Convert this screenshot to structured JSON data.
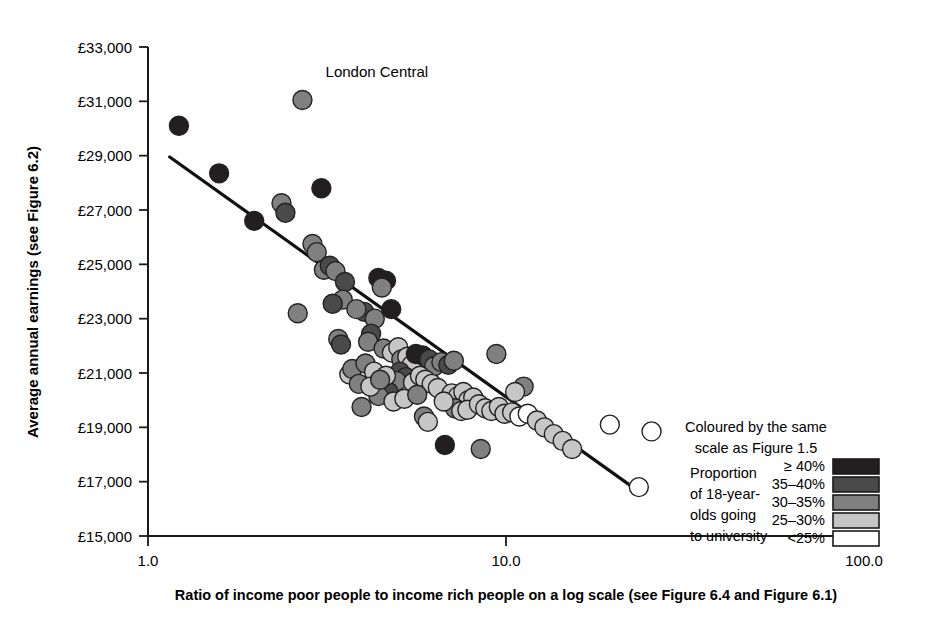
{
  "chart_data": {
    "type": "scatter",
    "title": "",
    "xlabel": "Ratio of income poor people to income rich people on a log scale (see Figure 6.4 and Figure 6.1)",
    "ylabel": "Average annual earnings (see Figure 6.2)",
    "xscale": "log",
    "xlim": [
      1.0,
      100.0
    ],
    "ylim": [
      15000,
      33000
    ],
    "xticks": [
      "1.0",
      "10.0",
      "100.0"
    ],
    "xtick_values": [
      1.0,
      10.0,
      100.0
    ],
    "yticks": [
      "£15,000",
      "£17,000",
      "£19,000",
      "£21,000",
      "£23,000",
      "£25,000",
      "£27,000",
      "£29,000",
      "£31,000",
      "£33,000"
    ],
    "ytick_values": [
      15000,
      17000,
      19000,
      21000,
      23000,
      25000,
      27000,
      29000,
      31000,
      33000
    ],
    "grid": false,
    "legend_position": "bottom-right",
    "annotations": [
      {
        "text": "London Central",
        "x": 3.2,
        "y": 31900
      }
    ],
    "trendline": {
      "type": "linear-on-log",
      "x_start": 1.15,
      "y_start": 28950,
      "x_end": 24.0,
      "y_end": 16550
    },
    "color_bins": [
      {
        "label": "≥ 40%",
        "color": "#231f20"
      },
      {
        "label": "35–40%",
        "color": "#4a4a4a"
      },
      {
        "label": "30–35%",
        "color": "#808080"
      },
      {
        "label": "25–30%",
        "color": "#c6c6c6"
      },
      {
        "label": "<25%",
        "color": "#ffffff"
      }
    ],
    "points": [
      {
        "x": 1.22,
        "y": 30100,
        "bin": 0
      },
      {
        "x": 1.58,
        "y": 28350,
        "bin": 0
      },
      {
        "x": 2.7,
        "y": 31050,
        "bin": 2
      },
      {
        "x": 3.05,
        "y": 27800,
        "bin": 0
      },
      {
        "x": 1.98,
        "y": 26600,
        "bin": 0
      },
      {
        "x": 2.36,
        "y": 27250,
        "bin": 2
      },
      {
        "x": 2.42,
        "y": 26900,
        "bin": 1
      },
      {
        "x": 2.88,
        "y": 25750,
        "bin": 2
      },
      {
        "x": 2.96,
        "y": 25450,
        "bin": 2
      },
      {
        "x": 3.1,
        "y": 24800,
        "bin": 2
      },
      {
        "x": 3.22,
        "y": 24950,
        "bin": 1
      },
      {
        "x": 3.34,
        "y": 24750,
        "bin": 2
      },
      {
        "x": 3.55,
        "y": 24350,
        "bin": 1
      },
      {
        "x": 3.5,
        "y": 23700,
        "bin": 2
      },
      {
        "x": 4.4,
        "y": 24500,
        "bin": 0
      },
      {
        "x": 4.62,
        "y": 24400,
        "bin": 0
      },
      {
        "x": 4.5,
        "y": 24150,
        "bin": 2
      },
      {
        "x": 4.02,
        "y": 23250,
        "bin": 1
      },
      {
        "x": 3.82,
        "y": 23350,
        "bin": 2
      },
      {
        "x": 3.4,
        "y": 22250,
        "bin": 2
      },
      {
        "x": 3.46,
        "y": 22050,
        "bin": 1
      },
      {
        "x": 4.3,
        "y": 23000,
        "bin": 2
      },
      {
        "x": 4.78,
        "y": 23350,
        "bin": 0
      },
      {
        "x": 4.2,
        "y": 22450,
        "bin": 1
      },
      {
        "x": 4.12,
        "y": 22150,
        "bin": 2
      },
      {
        "x": 4.55,
        "y": 21900,
        "bin": 2
      },
      {
        "x": 4.8,
        "y": 21750,
        "bin": 3
      },
      {
        "x": 5.0,
        "y": 21950,
        "bin": 3
      },
      {
        "x": 5.1,
        "y": 21500,
        "bin": 2
      },
      {
        "x": 5.3,
        "y": 21600,
        "bin": 3
      },
      {
        "x": 5.45,
        "y": 21300,
        "bin": 3
      },
      {
        "x": 5.6,
        "y": 21700,
        "bin": 0
      },
      {
        "x": 5.85,
        "y": 21650,
        "bin": 0
      },
      {
        "x": 6.1,
        "y": 21500,
        "bin": 1
      },
      {
        "x": 6.3,
        "y": 21250,
        "bin": 2
      },
      {
        "x": 5.05,
        "y": 21050,
        "bin": 1
      },
      {
        "x": 5.25,
        "y": 20850,
        "bin": 1
      },
      {
        "x": 4.95,
        "y": 20700,
        "bin": 2
      },
      {
        "x": 5.5,
        "y": 20650,
        "bin": 3
      },
      {
        "x": 5.75,
        "y": 20900,
        "bin": 3
      },
      {
        "x": 5.95,
        "y": 20750,
        "bin": 3
      },
      {
        "x": 6.2,
        "y": 20600,
        "bin": 3
      },
      {
        "x": 6.45,
        "y": 20450,
        "bin": 3
      },
      {
        "x": 4.7,
        "y": 20300,
        "bin": 1
      },
      {
        "x": 4.4,
        "y": 20150,
        "bin": 2
      },
      {
        "x": 4.85,
        "y": 19950,
        "bin": 3
      },
      {
        "x": 5.2,
        "y": 20050,
        "bin": 3
      },
      {
        "x": 3.95,
        "y": 19750,
        "bin": 2
      },
      {
        "x": 6.6,
        "y": 21400,
        "bin": 2
      },
      {
        "x": 6.9,
        "y": 21300,
        "bin": 1
      },
      {
        "x": 7.15,
        "y": 21450,
        "bin": 2
      },
      {
        "x": 9.4,
        "y": 21700,
        "bin": 2
      },
      {
        "x": 7.05,
        "y": 20250,
        "bin": 3
      },
      {
        "x": 7.35,
        "y": 20150,
        "bin": 3
      },
      {
        "x": 7.6,
        "y": 20300,
        "bin": 3
      },
      {
        "x": 7.85,
        "y": 20000,
        "bin": 3
      },
      {
        "x": 8.1,
        "y": 20100,
        "bin": 3
      },
      {
        "x": 7.2,
        "y": 19700,
        "bin": 2
      },
      {
        "x": 7.5,
        "y": 19600,
        "bin": 3
      },
      {
        "x": 7.8,
        "y": 19650,
        "bin": 3
      },
      {
        "x": 8.4,
        "y": 19850,
        "bin": 3
      },
      {
        "x": 8.75,
        "y": 19700,
        "bin": 3
      },
      {
        "x": 9.1,
        "y": 19600,
        "bin": 3
      },
      {
        "x": 9.55,
        "y": 19750,
        "bin": 3
      },
      {
        "x": 9.9,
        "y": 19500,
        "bin": 3
      },
      {
        "x": 10.4,
        "y": 19550,
        "bin": 3
      },
      {
        "x": 10.9,
        "y": 19400,
        "bin": 4
      },
      {
        "x": 11.5,
        "y": 19500,
        "bin": 4
      },
      {
        "x": 11.2,
        "y": 20500,
        "bin": 2
      },
      {
        "x": 10.6,
        "y": 20300,
        "bin": 3
      },
      {
        "x": 12.2,
        "y": 19250,
        "bin": 3
      },
      {
        "x": 12.8,
        "y": 19000,
        "bin": 3
      },
      {
        "x": 13.6,
        "y": 18750,
        "bin": 3
      },
      {
        "x": 14.4,
        "y": 18500,
        "bin": 3
      },
      {
        "x": 15.3,
        "y": 18200,
        "bin": 3
      },
      {
        "x": 19.5,
        "y": 19100,
        "bin": 4
      },
      {
        "x": 25.5,
        "y": 18850,
        "bin": 4
      },
      {
        "x": 23.5,
        "y": 16800,
        "bin": 4
      },
      {
        "x": 6.75,
        "y": 18350,
        "bin": 0
      },
      {
        "x": 8.5,
        "y": 18200,
        "bin": 2
      },
      {
        "x": 5.9,
        "y": 19400,
        "bin": 2
      },
      {
        "x": 6.05,
        "y": 19200,
        "bin": 3
      },
      {
        "x": 3.65,
        "y": 20950,
        "bin": 3
      },
      {
        "x": 3.72,
        "y": 21150,
        "bin": 2
      },
      {
        "x": 4.05,
        "y": 21350,
        "bin": 2
      },
      {
        "x": 4.28,
        "y": 21050,
        "bin": 3
      },
      {
        "x": 4.62,
        "y": 20900,
        "bin": 3
      },
      {
        "x": 3.88,
        "y": 20600,
        "bin": 2
      },
      {
        "x": 4.18,
        "y": 20500,
        "bin": 3
      },
      {
        "x": 4.45,
        "y": 20750,
        "bin": 2
      },
      {
        "x": 5.65,
        "y": 20200,
        "bin": 2
      },
      {
        "x": 6.7,
        "y": 19950,
        "bin": 3
      },
      {
        "x": 2.62,
        "y": 23200,
        "bin": 2
      },
      {
        "x": 3.28,
        "y": 23550,
        "bin": 1
      }
    ]
  },
  "legend": {
    "caption_line1": "Coloured by the same",
    "caption_line2": "scale as Figure 1.5",
    "description_lines": [
      "Proportion",
      "of 18-year-",
      "olds going",
      "to university"
    ]
  }
}
